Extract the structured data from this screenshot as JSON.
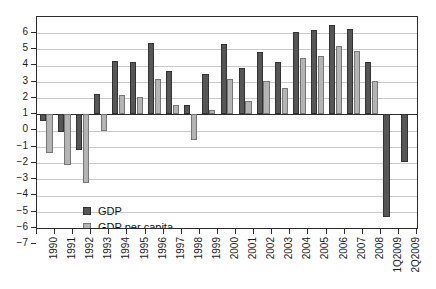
{
  "chart_data": {
    "type": "bar",
    "title": "",
    "subtitle": "",
    "xlabel": "",
    "ylabel": "",
    "ylim": [
      -7,
      6
    ],
    "yticks": [
      6,
      5,
      4,
      3,
      2,
      1,
      0,
      -1,
      -2,
      -3,
      -4,
      -5,
      -6,
      -7
    ],
    "ytick_labels": [
      "6",
      "5",
      "4",
      "3",
      "2",
      "1",
      "0",
      "-1",
      "-2",
      "-3",
      "-4",
      "-5",
      "-6",
      "-7"
    ],
    "grid": true,
    "legend_position": "inside-bottom-left",
    "categories": [
      "1990",
      "1991",
      "1992",
      "1993",
      "1994",
      "1995",
      "1996",
      "1997",
      "1998",
      "1999",
      "2000",
      "2001",
      "2002",
      "2003",
      "2004",
      "2005",
      "2006",
      "2007",
      "2008",
      "1Q2009",
      "2Q2009"
    ],
    "series": [
      {
        "name": "GDP",
        "color": "#565656",
        "values": [
          -0.4,
          -1.1,
          -2.2,
          1.25,
          3.3,
          3.25,
          4.4,
          2.7,
          0.6,
          2.5,
          4.35,
          2.85,
          3.85,
          3.25,
          5.1,
          5.2,
          5.5,
          5.25,
          3.25,
          -6.35,
          -2.95
        ]
      },
      {
        "name": "GDP per capita",
        "color": "#b4b4b4",
        "values": [
          -2.4,
          -3.1,
          -4.2,
          -1.0,
          1.2,
          1.1,
          2.2,
          0.55,
          -1.55,
          0.3,
          2.2,
          0.85,
          2.05,
          1.6,
          3.5,
          3.6,
          4.2,
          3.9,
          2.05,
          null,
          null
        ]
      }
    ]
  },
  "legend": {
    "items": [
      {
        "label": "GDP",
        "key": "gdp"
      },
      {
        "label": "GDP per capita",
        "key": "pc"
      }
    ]
  },
  "colors": {
    "gdp": "#565656",
    "gdp_per_capita": "#b4b4b4",
    "axis": "#2b2b2b",
    "grid": "#c9c9c9",
    "background": "#ffffff"
  }
}
